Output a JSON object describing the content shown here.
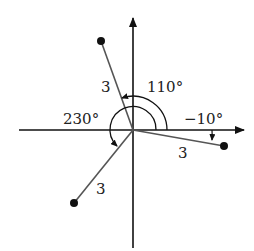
{
  "diagram": {
    "type": "polar-vectors",
    "origin": {
      "x": 133,
      "y": 130
    },
    "vectors": [
      {
        "name": "vector-110",
        "magnitude_label": "3",
        "angle_label": "110°",
        "angle_deg": 110,
        "end": {
          "x": 101,
          "y": 41
        }
      },
      {
        "name": "vector-neg10",
        "magnitude_label": "3",
        "angle_label": "−10°",
        "angle_deg": -10,
        "end": {
          "x": 224,
          "y": 146
        }
      },
      {
        "name": "vector-230",
        "magnitude_label": "3",
        "angle_label": "230°",
        "angle_deg": 230,
        "end": {
          "x": 74,
          "y": 203
        }
      }
    ]
  },
  "labels": {
    "mag_110": "3",
    "mag_neg10": "3",
    "mag_230": "3",
    "angle_110": "110°",
    "angle_neg10": "−10°",
    "angle_230": "230°"
  },
  "colors": {
    "axis": "#111111",
    "vector": "#555555",
    "point": "#111111",
    "background": "#ffffff"
  }
}
